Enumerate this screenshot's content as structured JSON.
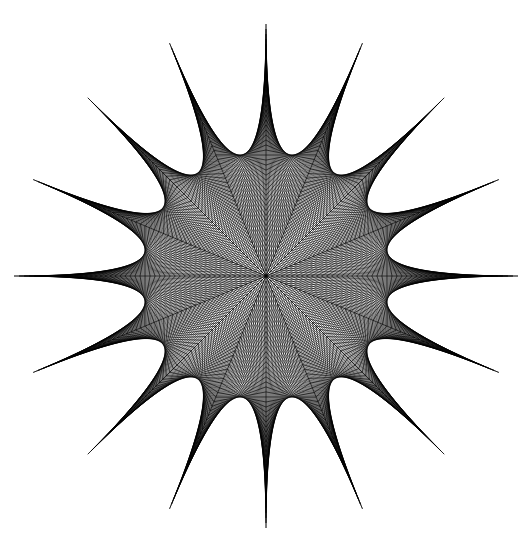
{
  "figure": {
    "kind": "geometric-line-art",
    "background_color": "#ffffff",
    "stroke_color": "#000000",
    "stroke_width": 0.62,
    "canvas": {
      "width": 524,
      "height": 547
    }
  },
  "chart_data": {
    "type": "line",
    "subtitle": "",
    "xlabel": "",
    "ylabel": "",
    "grid": false,
    "legend_position": "none",
    "xlim": [
      0,
      524
    ],
    "ylim": [
      0,
      547
    ],
    "construction": {
      "method": "string-art-envelope",
      "center_x": 266,
      "center_y": 276,
      "num_spikes": 16,
      "num_rays": 16,
      "angle_step_degrees": 22.5,
      "start_angle_degrees": 90,
      "tip_radius": 252,
      "valley_radius": 116,
      "strings_per_sector": 26,
      "ray_point_count": 26,
      "stroke_color": "#000000",
      "background_color": "#ffffff"
    },
    "spike_tips": [
      {
        "index": 0,
        "angle_deg": 90.0,
        "x": 266,
        "y": 24
      },
      {
        "index": 1,
        "angle_deg": 112.5,
        "x": 169,
        "y": 43
      },
      {
        "index": 2,
        "angle_deg": 135.0,
        "x": 88,
        "y": 98
      },
      {
        "index": 3,
        "angle_deg": 157.5,
        "x": 33,
        "y": 180
      },
      {
        "index": 4,
        "angle_deg": 180.0,
        "x": 14,
        "y": 276
      },
      {
        "index": 5,
        "angle_deg": 202.5,
        "x": 33,
        "y": 372
      },
      {
        "index": 6,
        "angle_deg": 225.0,
        "x": 88,
        "y": 454
      },
      {
        "index": 7,
        "angle_deg": 247.5,
        "x": 169,
        "y": 509
      },
      {
        "index": 8,
        "angle_deg": 270.0,
        "x": 266,
        "y": 528
      },
      {
        "index": 9,
        "angle_deg": 292.5,
        "x": 362,
        "y": 509
      },
      {
        "index": 10,
        "angle_deg": 315.0,
        "x": 444,
        "y": 454
      },
      {
        "index": 11,
        "angle_deg": 337.5,
        "x": 499,
        "y": 372
      },
      {
        "index": 12,
        "angle_deg": 0.0,
        "x": 518,
        "y": 276
      },
      {
        "index": 13,
        "angle_deg": 22.5,
        "x": 499,
        "y": 180
      },
      {
        "index": 14,
        "angle_deg": 45.0,
        "x": 444,
        "y": 98
      },
      {
        "index": 15,
        "angle_deg": 67.5,
        "x": 362,
        "y": 43
      }
    ],
    "series": [
      {
        "name": "envelope-strings",
        "count": 832,
        "description": "Straight segments from point i on ray k to point (n-1-i) on ray k+1"
      }
    ]
  }
}
